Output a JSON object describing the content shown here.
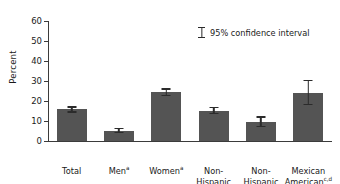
{
  "chart_data": {
    "type": "bar",
    "title": "",
    "xlabel": "",
    "ylabel": "Percent",
    "ylim": [
      0,
      60
    ],
    "ytick_values": [
      0,
      10,
      20,
      30,
      40,
      50,
      60
    ],
    "ytick_labels": [
      "0",
      "10",
      "20",
      "30",
      "40",
      "50",
      "60"
    ],
    "grid": false,
    "legend_position": "upper-right-inside",
    "legend": [
      {
        "label": "95% confidence interval",
        "glyph": "error-bar-icon"
      }
    ],
    "bar_color": "#545454",
    "error_color": "#2b2b2b",
    "axis_color": "#3b3b3b",
    "categories": [
      "Total",
      "Men",
      "Women",
      "Non-Hispanic white",
      "Non-Hispanic black",
      "Mexican American"
    ],
    "category_superscripts": [
      "",
      "a",
      "a",
      "b,c",
      "b,d",
      "c,d"
    ],
    "category_lines": [
      [
        "Total"
      ],
      [
        "Men"
      ],
      [
        "Women"
      ],
      [
        "Non-Hispanic",
        "white"
      ],
      [
        "Non-Hispanic",
        "black"
      ],
      [
        "Mexican",
        "American"
      ]
    ],
    "values": [
      15.8,
      5.2,
      24.3,
      15.1,
      9.6,
      24.1
    ],
    "ci_low": [
      14.2,
      3.9,
      22.3,
      13.5,
      6.9,
      17.8
    ],
    "ci_high": [
      17.4,
      6.5,
      26.3,
      17.0,
      12.4,
      30.6
    ],
    "bars": [
      {
        "category": "Total",
        "superscript": "",
        "value": 15.8,
        "ci_low": 14.2,
        "ci_high": 17.4
      },
      {
        "category": "Men",
        "superscript": "a",
        "value": 5.2,
        "ci_low": 3.9,
        "ci_high": 6.5
      },
      {
        "category": "Women",
        "superscript": "a",
        "value": 24.3,
        "ci_low": 22.3,
        "ci_high": 26.3
      },
      {
        "category": "Non-Hispanic white",
        "superscript": "b,c",
        "value": 15.1,
        "ci_low": 13.5,
        "ci_high": 17.0
      },
      {
        "category": "Non-Hispanic black",
        "superscript": "b,d",
        "value": 9.6,
        "ci_low": 6.9,
        "ci_high": 12.4
      },
      {
        "category": "Mexican American",
        "superscript": "c,d",
        "value": 24.1,
        "ci_low": 17.8,
        "ci_high": 30.6
      }
    ]
  }
}
